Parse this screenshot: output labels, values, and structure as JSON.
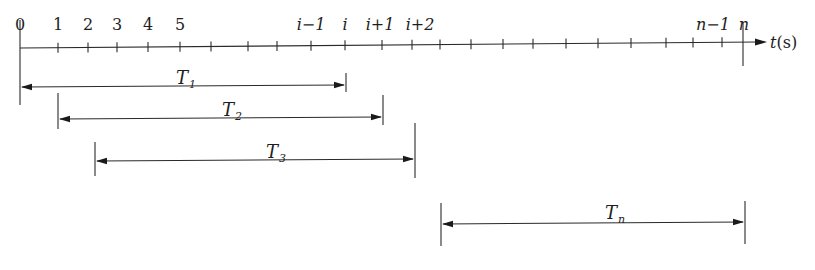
{
  "diagram": {
    "type": "timeline",
    "axis": {
      "label_var": "t",
      "label_unit": "(s)",
      "tick_x": [
        20,
        58,
        88,
        117,
        148,
        180,
        211,
        248,
        277,
        311,
        345,
        382,
        412,
        440,
        471,
        503,
        533,
        566,
        598,
        631,
        666,
        693,
        722,
        743
      ],
      "tick_labels": [
        {
          "text": "0",
          "x": 20,
          "italic": false
        },
        {
          "text": "1",
          "x": 58,
          "italic": false
        },
        {
          "text": "2",
          "x": 88,
          "italic": false
        },
        {
          "text": "3",
          "x": 117,
          "italic": false
        },
        {
          "text": "4",
          "x": 148,
          "italic": false
        },
        {
          "text": "5",
          "x": 180,
          "italic": false
        },
        {
          "text": "i−1",
          "x": 311,
          "italic": true
        },
        {
          "text": "i",
          "x": 345,
          "italic": true
        },
        {
          "text": "i+1",
          "x": 380,
          "italic": true
        },
        {
          "text": "i+2",
          "x": 420,
          "italic": true
        },
        {
          "text": "n−1",
          "x": 713,
          "italic": true
        },
        {
          "text": "n",
          "x": 744,
          "italic": true
        }
      ]
    },
    "intervals": [
      {
        "name": "T",
        "sub": "1",
        "x1": 20,
        "x2": 346,
        "y": 87,
        "bar1": [
          20,
          105
        ],
        "bar2": [
          73,
          92
        ],
        "label_x": 176,
        "label_y": 84
      },
      {
        "name": "T",
        "sub": "2",
        "x1": 58,
        "x2": 383,
        "y": 119,
        "bar1": [
          93,
          129
        ],
        "bar2": [
          95,
          125
        ],
        "label_x": 222,
        "label_y": 116
      },
      {
        "name": "T",
        "sub": "3",
        "x1": 95,
        "x2": 415,
        "y": 161,
        "bar1": [
          142,
          176
        ],
        "bar2": [
          123,
          178
        ],
        "label_x": 266,
        "label_y": 158
      },
      {
        "name": "T",
        "sub": "n",
        "x1": 441,
        "x2": 745,
        "y": 224,
        "bar1": [
          203,
          246
        ],
        "bar2": [
          201,
          244
        ],
        "label_x": 605,
        "label_y": 219
      }
    ]
  }
}
